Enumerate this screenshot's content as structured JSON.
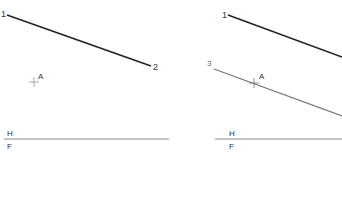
{
  "panels": [
    {
      "id": "left",
      "line_1_2": {
        "x1": 7,
        "y1": 15,
        "x2": 151,
        "y2": 66,
        "color": "#222222",
        "width": 1.6
      },
      "labels": {
        "p1": {
          "text": "1",
          "x": 1,
          "y": 17
        },
        "p2": {
          "text": "2",
          "x": 153,
          "y": 70
        },
        "pointA": {
          "text": "A",
          "x": 38,
          "y": 79
        },
        "H": {
          "text": "H",
          "x": 7,
          "y": 136
        },
        "F": {
          "text": "F",
          "x": 7,
          "y": 149
        }
      },
      "cross_A": {
        "x": 34,
        "y": 82
      },
      "fold_line": {
        "x1": 4,
        "y1": 139,
        "x2": 169,
        "y2": 139,
        "color": "#888888"
      }
    },
    {
      "id": "right",
      "line_1_2": {
        "x1": 228,
        "y1": 15,
        "x2": 342,
        "y2": 57,
        "color": "#222222",
        "width": 1.6
      },
      "line_3": {
        "x1": 214,
        "y1": 69,
        "x2": 342,
        "y2": 116,
        "color": "#777777",
        "width": 1.2
      },
      "labels": {
        "p1": {
          "text": "1",
          "x": 222,
          "y": 18
        },
        "p3": {
          "text": "3",
          "x": 207,
          "y": 66
        },
        "pointA": {
          "text": "A",
          "x": 259,
          "y": 79
        },
        "H": {
          "text": "H",
          "x": 229,
          "y": 136
        },
        "F": {
          "text": "F",
          "x": 229,
          "y": 149
        }
      },
      "cross_A": {
        "x": 254,
        "y": 83
      },
      "fold_line": {
        "x1": 215,
        "y1": 139,
        "x2": 342,
        "y2": 139,
        "color": "#888888"
      }
    }
  ]
}
